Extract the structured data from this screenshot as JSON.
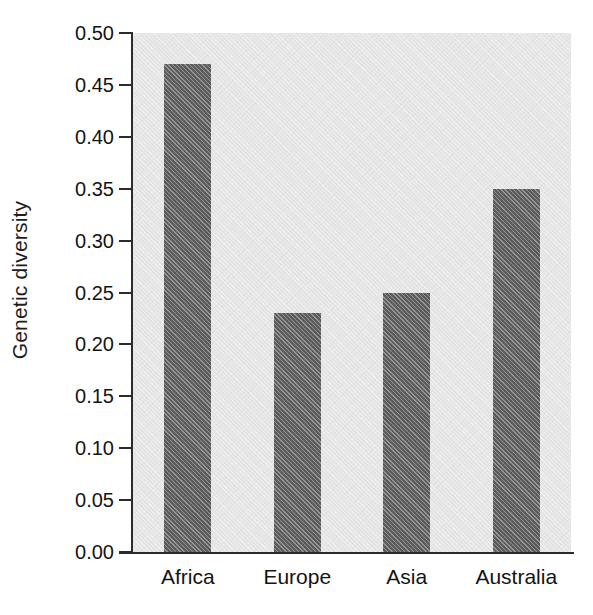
{
  "chart_data": {
    "type": "bar",
    "title": "",
    "subtitle": "",
    "xlabel": "",
    "ylabel": "Genetic diversity",
    "categories": [
      "Africa",
      "Europe",
      "Asia",
      "Australia"
    ],
    "values": [
      0.47,
      0.23,
      0.25,
      0.35
    ],
    "series": [
      {
        "name": "Genetic diversity",
        "values": [
          0.47,
          0.23,
          0.25,
          0.35
        ]
      }
    ],
    "ylim": [
      0.0,
      0.5
    ],
    "ytick_labels": [
      "0.50",
      "0.45",
      "0.40",
      "0.35",
      "0.30",
      "0.25",
      "0.20",
      "0.15",
      "0.10",
      "0.05",
      "0.00"
    ],
    "ytick_values": [
      0.5,
      0.45,
      0.4,
      0.35,
      0.3,
      0.25,
      0.2,
      0.15,
      0.1,
      0.05,
      0.0
    ],
    "grid": false,
    "legend": null,
    "legend_position": "none",
    "annotations": [],
    "colors": {
      "bar": "#5c5c5c",
      "plot_background": "#e5e5e5",
      "figure_background": "#ffffff",
      "axis": "#2b2b2b",
      "text": "#141414"
    }
  }
}
